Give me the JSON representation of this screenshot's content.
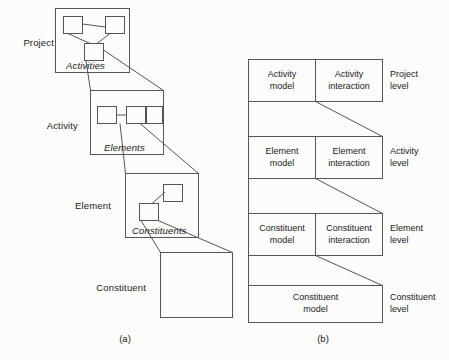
{
  "figure": {
    "caption_a": "(a)",
    "caption_b": "(b)"
  },
  "diagram_a": {
    "level_labels": [
      {
        "text": "Project"
      },
      {
        "text": "Activity"
      },
      {
        "text": "Element"
      },
      {
        "text": "Constituent"
      }
    ],
    "box_labels": [
      {
        "text": "Activities"
      },
      {
        "text": "Elements"
      },
      {
        "text": "Constituents"
      }
    ]
  },
  "diagram_b": {
    "rows": [
      {
        "model": "Activity\nmodel",
        "interaction": "Activity\ninteraction",
        "level": "Project\nlevel"
      },
      {
        "model": "Element\nmodel",
        "interaction": "Element\ninteraction",
        "level": "Activity\nlevel"
      },
      {
        "model": "Constituent\nmodel",
        "interaction": "Constituent\ninteraction",
        "level": "Element\nlevel"
      },
      {
        "model": "Constituent\nmodel",
        "interaction": "",
        "level": "Constituent\nlevel"
      }
    ]
  },
  "style": {
    "stroke": "#555555",
    "background": "#fcfcfb",
    "text": "#1a1a1a"
  }
}
